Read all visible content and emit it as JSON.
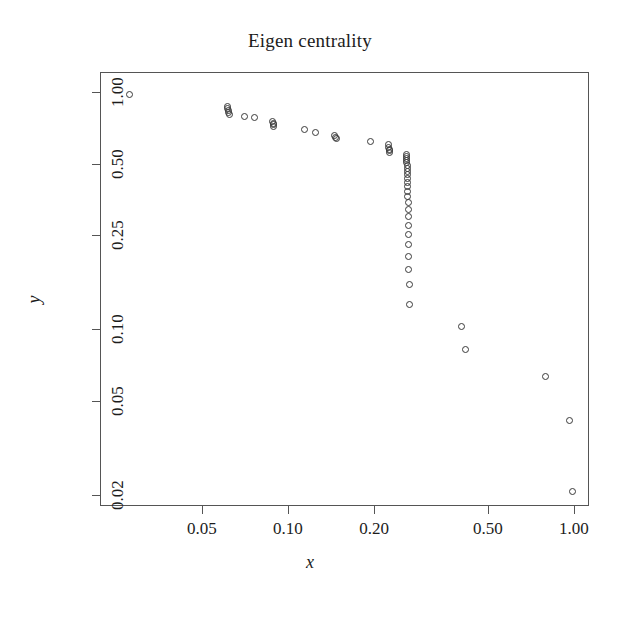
{
  "chart_data": {
    "type": "scatter",
    "title": "Eigen centrality",
    "xlabel": "x",
    "ylabel": "y",
    "xscale": "log",
    "yscale": "log",
    "grid": false,
    "legend": null,
    "xlim": [
      0.022,
      1.13
    ],
    "ylim": [
      0.018,
      1.22
    ],
    "xticks": [
      0.05,
      0.1,
      0.2,
      0.5,
      1.0
    ],
    "xtick_labels": [
      "0.05",
      "0.10",
      "0.20",
      "0.50",
      "1.00"
    ],
    "yticks": [
      1.0,
      0.5,
      0.25,
      0.1,
      0.05,
      0.02
    ],
    "ytick_labels": [
      "1.00",
      "0.50",
      "0.25",
      "0.10",
      "0.05",
      "0.02"
    ],
    "marker": "open-circle",
    "marker_color": "#3a3a3a",
    "points": [
      {
        "x": 0.0276,
        "y": 0.985
      },
      {
        "x": 0.061,
        "y": 0.88
      },
      {
        "x": 0.061,
        "y": 0.86
      },
      {
        "x": 0.0615,
        "y": 0.845
      },
      {
        "x": 0.0618,
        "y": 0.83
      },
      {
        "x": 0.062,
        "y": 0.815
      },
      {
        "x": 0.07,
        "y": 0.8
      },
      {
        "x": 0.0762,
        "y": 0.79
      },
      {
        "x": 0.088,
        "y": 0.76
      },
      {
        "x": 0.0885,
        "y": 0.748
      },
      {
        "x": 0.0888,
        "y": 0.735
      },
      {
        "x": 0.089,
        "y": 0.722
      },
      {
        "x": 0.114,
        "y": 0.7
      },
      {
        "x": 0.125,
        "y": 0.68
      },
      {
        "x": 0.145,
        "y": 0.66
      },
      {
        "x": 0.147,
        "y": 0.65
      },
      {
        "x": 0.148,
        "y": 0.642
      },
      {
        "x": 0.195,
        "y": 0.625
      },
      {
        "x": 0.225,
        "y": 0.605
      },
      {
        "x": 0.2255,
        "y": 0.592
      },
      {
        "x": 0.226,
        "y": 0.58
      },
      {
        "x": 0.2265,
        "y": 0.57
      },
      {
        "x": 0.227,
        "y": 0.56
      },
      {
        "x": 0.26,
        "y": 0.55
      },
      {
        "x": 0.2605,
        "y": 0.54
      },
      {
        "x": 0.2608,
        "y": 0.53
      },
      {
        "x": 0.261,
        "y": 0.52
      },
      {
        "x": 0.2612,
        "y": 0.508
      },
      {
        "x": 0.2615,
        "y": 0.495
      },
      {
        "x": 0.2618,
        "y": 0.482
      },
      {
        "x": 0.262,
        "y": 0.468
      },
      {
        "x": 0.2622,
        "y": 0.452
      },
      {
        "x": 0.2625,
        "y": 0.436
      },
      {
        "x": 0.2628,
        "y": 0.42
      },
      {
        "x": 0.263,
        "y": 0.402
      },
      {
        "x": 0.2632,
        "y": 0.384
      },
      {
        "x": 0.2635,
        "y": 0.365
      },
      {
        "x": 0.2638,
        "y": 0.345
      },
      {
        "x": 0.264,
        "y": 0.322
      },
      {
        "x": 0.2642,
        "y": 0.3
      },
      {
        "x": 0.2645,
        "y": 0.276
      },
      {
        "x": 0.2648,
        "y": 0.252
      },
      {
        "x": 0.265,
        "y": 0.228
      },
      {
        "x": 0.2652,
        "y": 0.204
      },
      {
        "x": 0.2655,
        "y": 0.18
      },
      {
        "x": 0.2658,
        "y": 0.155
      },
      {
        "x": 0.266,
        "y": 0.128
      },
      {
        "x": 0.405,
        "y": 0.103
      },
      {
        "x": 0.42,
        "y": 0.082
      },
      {
        "x": 0.8,
        "y": 0.063
      },
      {
        "x": 0.97,
        "y": 0.041
      },
      {
        "x": 1.0,
        "y": 0.0205
      }
    ]
  }
}
